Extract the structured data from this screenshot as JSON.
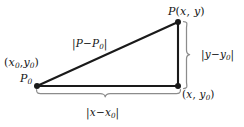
{
  "figure": {
    "type": "geometry-diagram",
    "background_color": "#ffffff",
    "line_color": "#1a1a1a",
    "brace_color": "#8c8c8c",
    "width": 244,
    "height": 127
  },
  "points": {
    "p0": {
      "name": "P0",
      "label": "P",
      "subscript": "0",
      "coord_label_open": "(",
      "coord_x": "x",
      "coord_x_sub": "0",
      "coord_sep": ",",
      "coord_y": "y",
      "coord_y_sub": "0",
      "coord_label_close": ")",
      "x": 37,
      "y": 86
    },
    "p": {
      "name": "P",
      "label": "P",
      "coord_open": "(",
      "coord_x": "x",
      "coord_sep": ", ",
      "coord_y": "y",
      "coord_close": ")",
      "x": 178,
      "y": 22
    },
    "corner": {
      "name": "right-angle-corner",
      "coord_open": "(",
      "coord_x": "x",
      "coord_sep": ", ",
      "coord_y": "y",
      "coord_y_sub": "0",
      "coord_close": ")",
      "x": 178,
      "y": 86
    }
  },
  "labels": {
    "hypotenuse": {
      "bar_open": "|",
      "p": "P",
      "minus": "−",
      "p0": "P",
      "p0_sub": "0",
      "bar_close": "|"
    },
    "vertical_leg": {
      "bar_open": "|",
      "y": "y",
      "minus": "−",
      "y0": "y",
      "y0_sub": "0",
      "bar_close": "|"
    },
    "horizontal_leg": {
      "bar_open": "|",
      "x": "x",
      "minus": "−",
      "x0": "x",
      "x0_sub": "0",
      "bar_close": "|"
    }
  },
  "braces": {
    "vertical": {
      "name": "vertical-brace",
      "orientation": "vertical",
      "from_y": 22,
      "to_y": 88,
      "at_x": 186,
      "tip_direction": "right"
    },
    "horizontal": {
      "name": "horizontal-brace",
      "orientation": "horizontal",
      "from_x": 37,
      "to_x": 180,
      "at_y": 94,
      "tip_direction": "down"
    }
  },
  "segments": [
    {
      "name": "hypotenuse",
      "from": "p0",
      "to": "p"
    },
    {
      "name": "vertical-leg",
      "from": "p",
      "to": "corner"
    },
    {
      "name": "horizontal-leg",
      "from": "p0",
      "to": "corner"
    }
  ]
}
